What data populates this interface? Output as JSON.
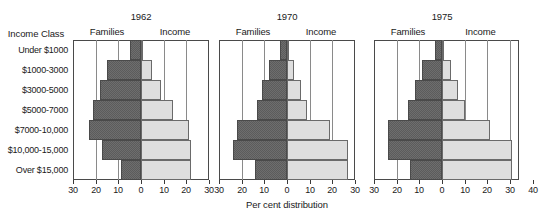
{
  "chart_data": {
    "type": "bar",
    "title": "",
    "xlabel": "Per cent distribution",
    "ylabel": "Income Class",
    "categories": [
      "Under $1000",
      "$1000-3000",
      "$3000-5000",
      "$5000-7000",
      "$7000-10,000",
      "$10,000-15,000",
      "Over $15,000"
    ],
    "grid": true,
    "legend_position": "above-panels",
    "orientation": "horizontal-diverging",
    "panels": [
      {
        "title": "1962",
        "left_label": "Families",
        "right_label": "Income",
        "xlim": [
          -30,
          30
        ],
        "ticks": [
          30,
          20,
          10,
          0,
          10,
          20,
          30
        ],
        "series": [
          {
            "name": "Families",
            "side": "left",
            "values": [
              5,
              15,
              18,
              21,
              23,
              17,
              9
            ]
          },
          {
            "name": "Income",
            "side": "right",
            "values": [
              1,
              5,
              9,
              14,
              21,
              22,
              22
            ]
          }
        ]
      },
      {
        "title": "1970",
        "left_label": "Families",
        "right_label": "Income",
        "xlim": [
          -30,
          30
        ],
        "ticks": [
          30,
          20,
          10,
          0,
          10,
          20,
          30
        ],
        "values_note": "left=Families, right=Income",
        "series": [
          {
            "name": "Families",
            "side": "left",
            "values": [
              3,
              8,
              11,
              13,
              22,
              24,
              14
            ]
          },
          {
            "name": "Income",
            "side": "right",
            "values": [
              1,
              3,
              6,
              9,
              19,
              27,
              27
            ]
          }
        ]
      },
      {
        "title": "1975",
        "left_label": "Families",
        "right_label": "Income",
        "xlim": [
          -30,
          40
        ],
        "ticks": [
          30,
          20,
          10,
          0,
          10,
          20,
          30,
          40
        ],
        "series": [
          {
            "name": "Families",
            "side": "left",
            "values": [
              3,
              9,
              12,
              15,
              24,
              24,
              14
            ]
          },
          {
            "name": "Income",
            "side": "right",
            "values": [
              1,
              4,
              7,
              10,
              21,
              31,
              31
            ]
          }
        ]
      }
    ]
  },
  "axis": {
    "y_header": "Income Class",
    "x_title": "Per cent distribution"
  }
}
